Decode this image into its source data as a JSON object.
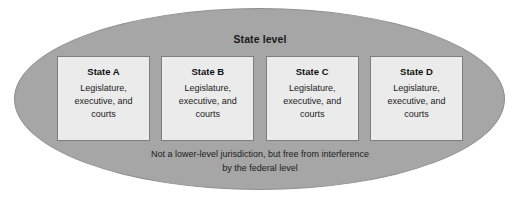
{
  "diagram": {
    "title": "State level",
    "container_shape": "ellipse",
    "colors": {
      "ellipse_fill": "#a6a6a6",
      "ellipse_border": "#8f8f8f",
      "box_fill": "#ebebeb",
      "box_border": "#7f7f7f",
      "text": "#1a1a1a",
      "background": "#ffffff"
    },
    "boxes": [
      {
        "name": "State A",
        "description": "Legislature, executive, and courts"
      },
      {
        "name": "State B",
        "description": "Legislature, executive, and courts"
      },
      {
        "name": "State C",
        "description": "Legislature, executive, and courts"
      },
      {
        "name": "State D",
        "description": "Legislature, executive, and courts"
      }
    ],
    "caption": {
      "line1": "Not a lower-level jurisdiction, but free from interference",
      "line2": "by the federal level"
    }
  }
}
